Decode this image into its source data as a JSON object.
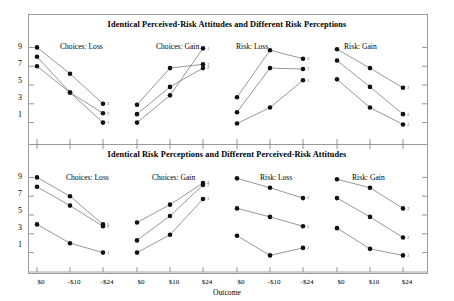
{
  "figure": {
    "axis_label_x": "Outcome",
    "y_ticks": [
      "9",
      "7",
      "5",
      "3",
      "1"
    ],
    "x_ticks": [
      "$0",
      "-$10",
      "-$24",
      "$0",
      "$10",
      "$24",
      "$0",
      "-$10",
      "-$24",
      "$0",
      "$10",
      "$24"
    ]
  },
  "panels": {
    "top_title": "Identical Perceived-Risk Attitudes and Different Risk Perceptions",
    "bottom_title": "Identical Risk Perceptions and Different Perceived-Risk Attitudes",
    "labels": [
      "Choices: Loss",
      "Choices: Gain",
      "Risk: Loss",
      "Risk: Gain"
    ]
  },
  "chart_data": {
    "type": "line",
    "xlabel": "Outcome",
    "ylabel": "",
    "ylim": [
      0,
      10
    ],
    "grid": false,
    "legend": "none",
    "point_labels": [
      "3",
      "2",
      "1"
    ],
    "subplots": [
      {
        "row": "top",
        "title": "Choices: Loss",
        "categories": [
          "$0",
          "-$10",
          "-$24"
        ],
        "series": [
          {
            "name": "3",
            "values": [
              9.0,
              6.2,
              3.0
            ]
          },
          {
            "name": "2",
            "values": [
              8.0,
              4.2,
              2.0
            ]
          },
          {
            "name": "1",
            "values": [
              7.0,
              4.2,
              1.0
            ]
          }
        ]
      },
      {
        "row": "top",
        "title": "Choices: Gain",
        "categories": [
          "$0",
          "$10",
          "$24"
        ],
        "series": [
          {
            "name": "1",
            "values": [
              1.0,
              3.9,
              8.9
            ]
          },
          {
            "name": "3",
            "values": [
              2.9,
              6.8,
              7.2
            ]
          },
          {
            "name": "2",
            "values": [
              1.9,
              4.8,
              6.8
            ]
          }
        ]
      },
      {
        "row": "top",
        "title": "Risk: Loss",
        "categories": [
          "$0",
          "-$10",
          "-$24"
        ],
        "series": [
          {
            "name": "3",
            "values": [
              3.7,
              8.7,
              7.8
            ]
          },
          {
            "name": "2",
            "values": [
              2.1,
              6.8,
              6.7
            ]
          },
          {
            "name": "1",
            "values": [
              0.9,
              2.6,
              5.5
            ]
          }
        ]
      },
      {
        "row": "top",
        "title": "Risk: Gain",
        "categories": [
          "$0",
          "$10",
          "$24"
        ],
        "series": [
          {
            "name": "3",
            "values": [
              8.8,
              6.8,
              4.7
            ]
          },
          {
            "name": "2",
            "values": [
              7.6,
              4.8,
              1.9
            ]
          },
          {
            "name": "1",
            "values": [
              5.6,
              2.6,
              0.8
            ]
          }
        ]
      },
      {
        "row": "bottom",
        "title": "Choices: Loss",
        "categories": [
          "$0",
          "-$10",
          "-$24"
        ],
        "series": [
          {
            "name": "3",
            "values": [
              9.0,
              7.0,
              4.0
            ]
          },
          {
            "name": "2",
            "values": [
              8.0,
              6.0,
              3.8
            ]
          },
          {
            "name": "1",
            "values": [
              4.0,
              2.0,
              1.0
            ]
          }
        ]
      },
      {
        "row": "bottom",
        "title": "Choices: Gain",
        "categories": [
          "$0",
          "$10",
          "$24"
        ],
        "series": [
          {
            "name": "2",
            "values": [
              4.2,
              6.1,
              8.4
            ]
          },
          {
            "name": "3",
            "values": [
              2.3,
              4.9,
              8.2
            ]
          },
          {
            "name": "1",
            "values": [
              1.0,
              2.9,
              6.7
            ]
          }
        ]
      },
      {
        "row": "bottom",
        "title": "Risk: Loss",
        "categories": [
          "$0",
          "-$10",
          "-$24"
        ],
        "series": [
          {
            "name": "3",
            "values": [
              8.9,
              7.9,
              6.8
            ]
          },
          {
            "name": "2",
            "values": [
              5.7,
              4.8,
              3.8
            ]
          },
          {
            "name": "1",
            "values": [
              2.8,
              0.7,
              1.5
            ]
          }
        ]
      },
      {
        "row": "bottom",
        "title": "Risk: Gain",
        "categories": [
          "$0",
          "$10",
          "$24"
        ],
        "series": [
          {
            "name": "3",
            "values": [
              8.8,
              7.9,
              5.7
            ]
          },
          {
            "name": "2",
            "values": [
              6.8,
              4.8,
              2.6
            ]
          },
          {
            "name": "1",
            "values": [
              3.6,
              1.4,
              0.7
            ]
          }
        ]
      }
    ]
  }
}
